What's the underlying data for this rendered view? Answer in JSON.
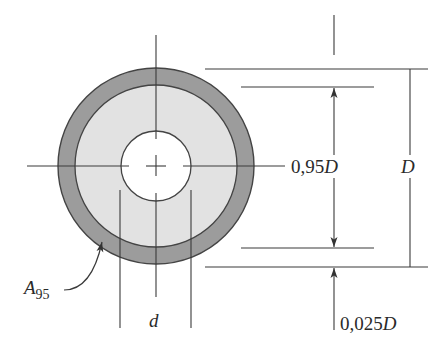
{
  "diagram": {
    "colors": {
      "background": "#ffffff",
      "outer_ring": "#9c9c9c",
      "inner_area": "#e2e2e2",
      "hole": "#ffffff",
      "line": "#3a3a3a"
    },
    "labels": {
      "inner_diameter_value": "0,95",
      "inner_diameter_symbol": "D",
      "outer_diameter_symbol": "D",
      "ring_thickness_value": "0,025",
      "ring_thickness_symbol": "D",
      "hole_diameter": "d",
      "area_symbol": "A",
      "area_subscript": "95"
    }
  }
}
